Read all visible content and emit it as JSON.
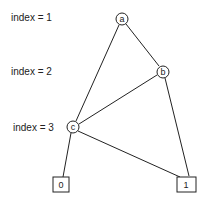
{
  "levels": [
    {
      "label": "index = 1",
      "y": 21
    },
    {
      "label": "index = 2",
      "y": 75
    },
    {
      "label": "index = 3",
      "y": 131
    }
  ],
  "nodes": [
    {
      "id": "a",
      "label": "a",
      "shape": "circle",
      "x": 122,
      "y": 19
    },
    {
      "id": "b",
      "label": "b",
      "shape": "circle",
      "x": 163,
      "y": 72
    },
    {
      "id": "c",
      "label": "c",
      "shape": "circle",
      "x": 73,
      "y": 127
    },
    {
      "id": "zero",
      "label": "0",
      "shape": "box",
      "x": 61,
      "y": 184
    },
    {
      "id": "one",
      "label": "1",
      "shape": "box",
      "x": 186,
      "y": 184
    }
  ],
  "edges": [
    {
      "from": "a",
      "to": "c"
    },
    {
      "from": "a",
      "to": "b"
    },
    {
      "from": "b",
      "to": "c"
    },
    {
      "from": "b",
      "to": "one"
    },
    {
      "from": "c",
      "to": "zero"
    },
    {
      "from": "c",
      "to": "one"
    }
  ]
}
